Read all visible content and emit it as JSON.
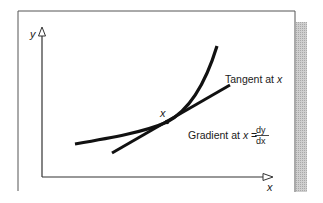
{
  "diagram": {
    "axes": {
      "y_label": "y",
      "x_label": "x"
    },
    "labels": {
      "tangent": "Tangent at ",
      "tangent_var": "x",
      "point": "x",
      "gradient_prefix": "Gradient at ",
      "gradient_var": "x",
      "gradient_eq": " = ",
      "numerator": "dy",
      "denominator": "dx"
    },
    "colors": {
      "ink": "#111111",
      "frame": "#555555",
      "shadow": "#bdbdbd",
      "background": "#ffffff"
    }
  }
}
